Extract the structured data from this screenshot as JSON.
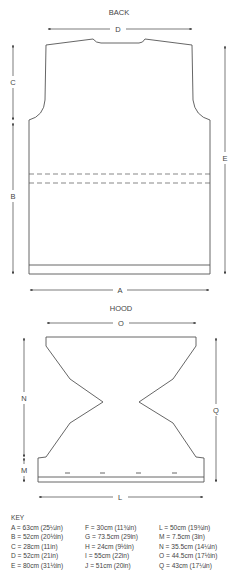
{
  "back": {
    "title": "BACK",
    "labels": {
      "A": "A",
      "B": "B",
      "C": "C",
      "D": "D",
      "E": "E"
    }
  },
  "hood": {
    "title": "HOOD",
    "labels": {
      "L": "L",
      "M": "M",
      "N": "N",
      "O": "O",
      "Q": "Q"
    }
  },
  "key": {
    "title": "KEY",
    "columns": [
      [
        "A = 63cm (25¼in)",
        "B = 52cm (20½in)",
        "C = 28cm (11in)",
        "D = 52cm (21in)",
        "E = 80cm (31½in)"
      ],
      [
        "F = 30cm (11¾in)",
        "G = 73.5cm (29in)",
        "H = 24cm (9½in)",
        "I = 55cm (22in)",
        "J = 51cm (20in)"
      ],
      [
        "L = 50cm (19¾in)",
        "M = 7.5cm (3in)",
        "N = 35.5cm (14¼in)",
        "O = 44.5cm (17½in)",
        "Q = 43cm (17¼in)"
      ]
    ]
  },
  "colors": {
    "line": "#555555",
    "arrow": "#444444",
    "text": "#444444"
  }
}
